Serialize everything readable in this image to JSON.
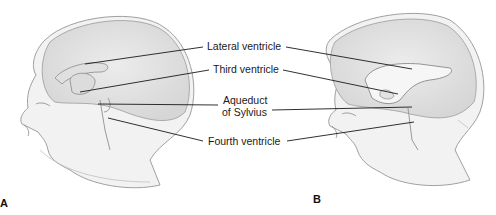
{
  "figure": {
    "panels": [
      {
        "id": "A",
        "label": "A",
        "description": "Sagittal view of infant head showing normal ventricular system"
      },
      {
        "id": "B",
        "label": "B",
        "description": "Sagittal view of infant head showing enlarged lateral ventricle"
      }
    ],
    "labels": {
      "lateral": "Lateral ventricle",
      "third": "Third ventricle",
      "aqueduct_line1": "Aqueduct",
      "aqueduct_line2": "of Sylvius",
      "fourth": "Fourth ventricle"
    },
    "colors": {
      "line": "#1a1a1a",
      "sketch": "#9a9a9a",
      "shade": "#e4e4e4"
    }
  }
}
